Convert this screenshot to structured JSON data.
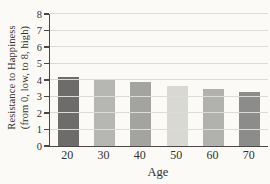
{
  "chart_data": {
    "type": "bar",
    "title": "",
    "categories": [
      "20",
      "30",
      "40",
      "50",
      "60",
      "70"
    ],
    "values": [
      4.2,
      4.0,
      3.85,
      3.65,
      3.45,
      3.3
    ],
    "bar_colors": [
      "#6e6b6b",
      "#b6b6b2",
      "#a3a39f",
      "#d9d9d3",
      "#b1b1ad",
      "#8c8c8a"
    ],
    "xlabel": "Age",
    "ylabel_line1": "Resistance to Happiness",
    "ylabel_line2": "(from 0, low, to 8, high)",
    "ylim": [
      0,
      8
    ],
    "ytick_step": 1,
    "ytick_labels": [
      "0",
      "1",
      "2",
      "3",
      "4",
      "5",
      "6",
      "7",
      "8"
    ],
    "grid": "horizontal",
    "legend": "none"
  },
  "colors": {
    "background": "#fbfaf7",
    "axis": "#4a4746",
    "gridline": "#dcdcd6",
    "text": "#33302e"
  }
}
